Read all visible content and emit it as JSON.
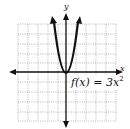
{
  "graph": {
    "x_axis_label": "x",
    "y_axis_label": "y",
    "function_label_main": "f(x) = 3x",
    "function_label_exponent": "2",
    "function": "f(x) = 3x^2",
    "grid": {
      "cells_x": 10,
      "cells_y": 10,
      "style": "dotted"
    },
    "curve": {
      "type": "parabola",
      "vertex": [
        0,
        0
      ],
      "opens": "up",
      "coefficient": 3
    },
    "colors": {
      "axis": "#111111",
      "curve": "#111111",
      "grid": "#777777",
      "background": "#ffffff"
    }
  }
}
